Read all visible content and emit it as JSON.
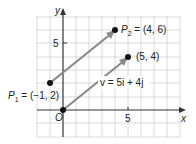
{
  "figure": {
    "axes": {
      "x_label": "x",
      "y_label": "y",
      "origin_label": "O",
      "x_tick_label": "5",
      "y_tick_label": "5"
    },
    "points": [
      {
        "name": "P1",
        "label_main": "P",
        "label_sub": "1",
        "label_rest": " = (−1, 2)",
        "x": -1,
        "y": 2
      },
      {
        "name": "P2",
        "label_main": "P",
        "label_sub": "2",
        "label_rest": " = (4, 6)",
        "x": 4,
        "y": 6
      },
      {
        "name": "origin",
        "x": 0,
        "y": 0
      },
      {
        "name": "Q",
        "label": "(5, 4)",
        "x": 5,
        "y": 4
      }
    ],
    "vector_label": "v = 5i + 4j",
    "colors": {
      "grid": "#d0d0d0",
      "axis": "#333333",
      "vector": "#8a8a8a",
      "point": "#111111"
    }
  }
}
